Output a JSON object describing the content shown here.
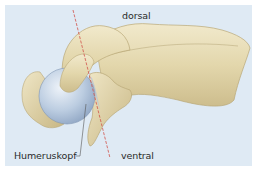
{
  "figure": {
    "labels": {
      "dorsal": "dorsal",
      "ventral": "ventral",
      "humeral_head": "Humeruskopf"
    },
    "colors": {
      "background_panel": "#dfeaf4",
      "page": "#ffffff",
      "bone": "#e4d9b0",
      "bone_shadow": "#c9b989",
      "bone_highlight": "#f3ecd2",
      "humeral_head": "#b9cbe0",
      "humeral_head_shadow": "#8fa6c4",
      "axis_line": "#d0524a",
      "leader_line": "#555555"
    }
  }
}
